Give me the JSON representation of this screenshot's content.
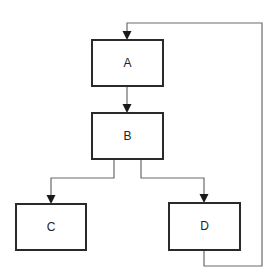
{
  "diagram": {
    "type": "flowchart",
    "nodes": [
      {
        "id": "A",
        "label": "A"
      },
      {
        "id": "B",
        "label": "B"
      },
      {
        "id": "C",
        "label": "C"
      },
      {
        "id": "D",
        "label": "D"
      }
    ],
    "edges": [
      {
        "from": "A",
        "to": "B"
      },
      {
        "from": "B",
        "to": "C"
      },
      {
        "from": "B",
        "to": "D"
      },
      {
        "from": "D",
        "to": "A"
      }
    ],
    "colors": {
      "box_stroke": "#2a2a2a",
      "line": "#6a6a6a",
      "background": "#ffffff"
    }
  }
}
